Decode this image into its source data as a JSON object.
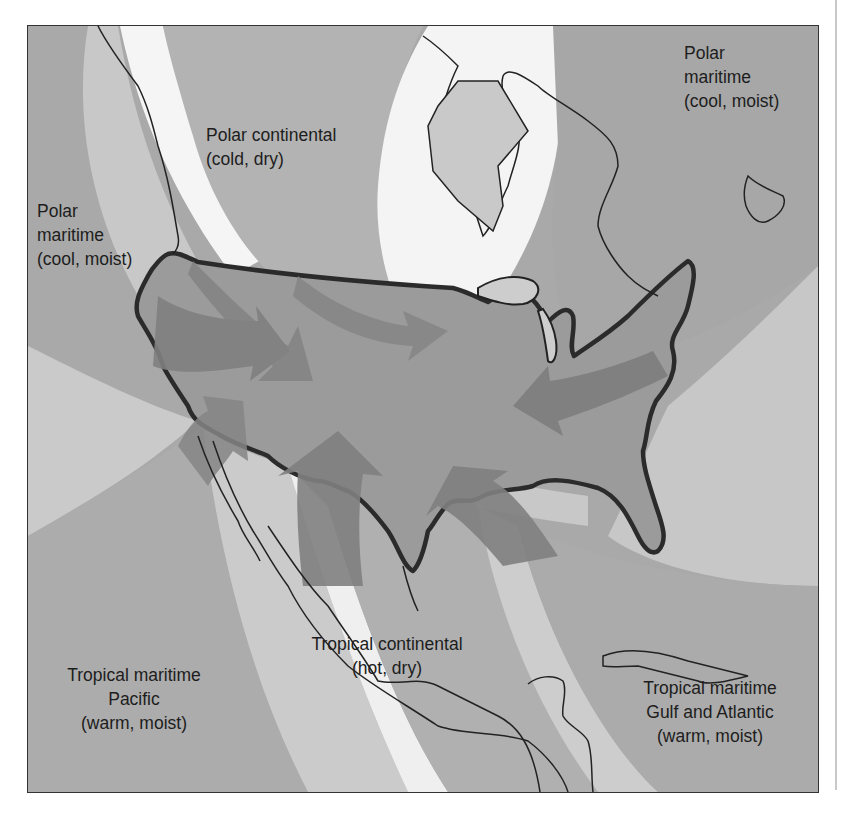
{
  "map": {
    "title": "North American air masses",
    "colors": {
      "background_dark": "#a8a8a8",
      "band_light": "#cfcfcf",
      "band_white": "#f8f8f8",
      "us_fill": "#9a9a9a",
      "arrow_fill": "#7f7f7f",
      "outline": "#2a2a2a"
    },
    "air_masses": [
      {
        "id": "polar-maritime-pacific",
        "name": "Polar",
        "name2": "maritime",
        "desc": "(cool, moist)"
      },
      {
        "id": "polar-continental",
        "name": "Polar continental",
        "desc": "(cold, dry)"
      },
      {
        "id": "polar-maritime-atlantic",
        "name": "Polar",
        "name2": "maritime",
        "desc": "(cool, moist)"
      },
      {
        "id": "tropical-maritime-pacific",
        "name": "Tropical maritime",
        "name2": "Pacific",
        "desc": "(warm, moist)"
      },
      {
        "id": "tropical-continental",
        "name": "Tropical continental",
        "desc": "(hot, dry)"
      },
      {
        "id": "tropical-maritime-gulf-atlantic",
        "name": "Tropical maritime",
        "name2": "Gulf and Atlantic",
        "desc": "(warm, moist)"
      }
    ],
    "arrows": [
      {
        "from": "polar-maritime-pacific",
        "direction": "southeast"
      },
      {
        "from": "polar-continental",
        "direction": "south"
      },
      {
        "from": "polar-continental",
        "direction": "southeast"
      },
      {
        "from": "polar-maritime-atlantic",
        "direction": "southwest"
      },
      {
        "from": "tropical-maritime-pacific",
        "direction": "northeast"
      },
      {
        "from": "tropical-continental",
        "direction": "north"
      },
      {
        "from": "tropical-maritime-gulf-atlantic",
        "direction": "northwest"
      }
    ]
  }
}
